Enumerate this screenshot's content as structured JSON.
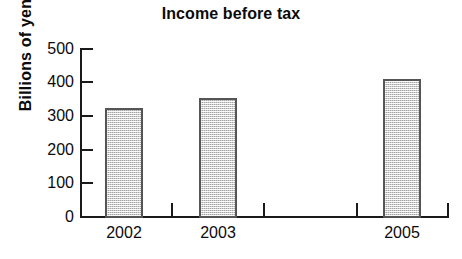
{
  "chart_data": {
    "type": "bar",
    "title": "Income before tax",
    "subtitle": "",
    "xlabel": "",
    "ylabel": "Billions of yen",
    "categories": [
      "2002",
      "2003",
      "",
      "2005"
    ],
    "values": [
      320,
      350,
      null,
      408
    ],
    "series": [
      {
        "name": "Income before tax",
        "values": [
          320,
          350,
          null,
          408
        ]
      }
    ],
    "ylim": [
      0,
      500
    ],
    "yticks": [
      0,
      100,
      200,
      300,
      400,
      500
    ],
    "ytick_labels": [
      "0",
      "100",
      "200",
      "300",
      "400",
      "500"
    ],
    "grid": false,
    "legend": false,
    "legend_position": "none",
    "bar_fill_color": "#d2d2d2",
    "bar_border_color": "#555555",
    "axis_color": "#1a1a1a",
    "text_color": "#0b0b0b",
    "background_color": "#ffffff"
  },
  "axis": {
    "y_title": "Billions of yen",
    "ticks": [
      {
        "label": "500",
        "value": 500
      },
      {
        "label": "400",
        "value": 400
      },
      {
        "label": "300",
        "value": 300
      },
      {
        "label": "200",
        "value": 200
      },
      {
        "label": "100",
        "value": 100
      },
      {
        "label": "0",
        "value": 0
      }
    ],
    "x_labels": [
      "2002",
      "2003",
      "2005"
    ]
  }
}
